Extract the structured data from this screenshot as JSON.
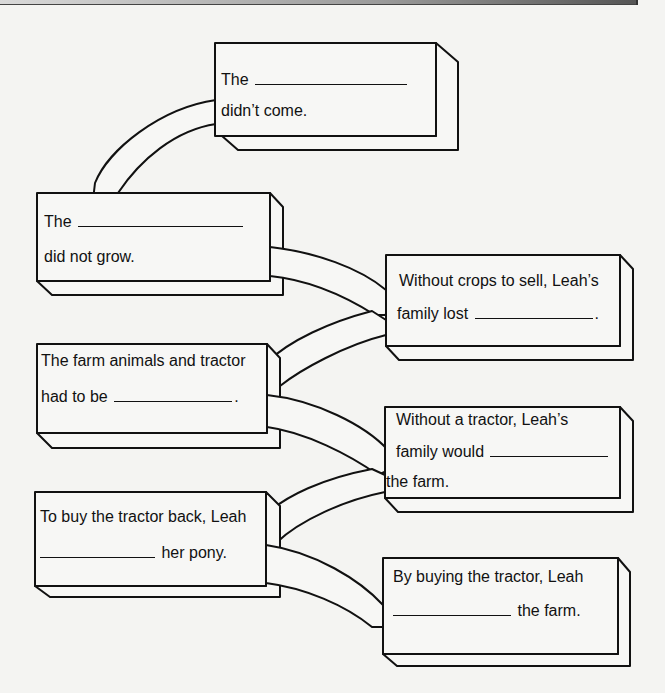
{
  "diagram": {
    "type": "cause-and-effect chain",
    "boxes": [
      {
        "id": "box-1",
        "line1_prefix": "The",
        "line1_suffix": "",
        "line2_prefix": "didn’t come.",
        "line2_suffix": "",
        "blank_line": 1
      },
      {
        "id": "box-2",
        "line1_prefix": "The",
        "line1_suffix": "",
        "line2_prefix": "did not grow.",
        "line2_suffix": "",
        "blank_line": 1
      },
      {
        "id": "box-3",
        "line1_prefix": "Without crops to sell, Leah’s",
        "line1_suffix": "",
        "line2_prefix": "family lost",
        "line2_suffix": ".",
        "blank_line": 2
      },
      {
        "id": "box-4",
        "line1_prefix": "The farm animals and tractor",
        "line1_suffix": "",
        "line2_prefix": "had to be",
        "line2_suffix": ".",
        "blank_line": 2
      },
      {
        "id": "box-5",
        "line1_prefix": "Without a tractor, Leah’s",
        "line1_suffix": "",
        "line2_prefix": "family would",
        "line2_suffix": "",
        "line3_prefix": "the farm.",
        "blank_line": 2
      },
      {
        "id": "box-6",
        "line1_prefix": "To buy the tractor back, Leah",
        "line1_suffix": "",
        "line2_prefix": "",
        "line2_suffix": "her pony.",
        "blank_line": 2
      },
      {
        "id": "box-7",
        "line1_prefix": "By buying the tractor, Leah",
        "line1_suffix": "",
        "line2_prefix": "",
        "line2_suffix": "the farm.",
        "blank_line": 2
      }
    ],
    "connectors": [
      {
        "from": "box-1",
        "to": "box-2"
      },
      {
        "from": "box-2",
        "to": "box-3"
      },
      {
        "from": "box-3",
        "to": "box-4"
      },
      {
        "from": "box-4",
        "to": "box-5"
      },
      {
        "from": "box-5",
        "to": "box-6"
      },
      {
        "from": "box-6",
        "to": "box-7"
      }
    ],
    "colors": {
      "background": "#f4f4f2",
      "box_fill": "#f7f7f5",
      "stroke": "#111111"
    }
  }
}
